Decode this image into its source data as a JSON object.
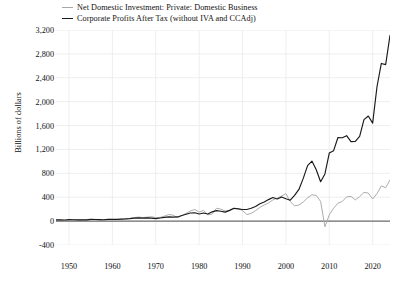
{
  "chart_data": {
    "type": "line",
    "title": "",
    "subtitle": "",
    "xlabel": "",
    "ylabel": "Billions of dollars",
    "xlim": [
      1947,
      2024
    ],
    "ylim": [
      -400,
      3200
    ],
    "grid": true,
    "legend_position": "top",
    "yticks": [
      "3,200",
      "2,800",
      "2,400",
      "2,000",
      "1,600",
      "1,200",
      "800",
      "400",
      "0",
      "-400"
    ],
    "ytick_values": [
      3200,
      2800,
      2400,
      2000,
      1600,
      1200,
      800,
      400,
      0,
      -400
    ],
    "xticks": [
      "1950",
      "1960",
      "1970",
      "1980",
      "1990",
      "2000",
      "2010",
      "2020"
    ],
    "xtick_values": [
      1950,
      1960,
      1970,
      1980,
      1990,
      2000,
      2010,
      2020
    ],
    "zero_line": 0,
    "series": [
      {
        "name": "Net Domestic Investment: Private: Domestic Business",
        "color": "#a8a8a8",
        "x": [
          1947,
          1948,
          1949,
          1950,
          1951,
          1952,
          1953,
          1954,
          1955,
          1956,
          1957,
          1958,
          1959,
          1960,
          1961,
          1962,
          1963,
          1964,
          1965,
          1966,
          1967,
          1968,
          1969,
          1970,
          1971,
          1972,
          1973,
          1974,
          1975,
          1976,
          1977,
          1978,
          1979,
          1980,
          1981,
          1982,
          1983,
          1984,
          1985,
          1986,
          1987,
          1988,
          1989,
          1990,
          1991,
          1992,
          1993,
          1994,
          1995,
          1996,
          1997,
          1998,
          1999,
          2000,
          2001,
          2002,
          2003,
          2004,
          2005,
          2006,
          2007,
          2008,
          2009,
          2010,
          2011,
          2012,
          2013,
          2014,
          2015,
          2016,
          2017,
          2018,
          2019,
          2020,
          2021,
          2022,
          2023,
          2024
        ],
        "y": [
          12,
          14,
          6,
          20,
          22,
          18,
          20,
          15,
          28,
          30,
          26,
          14,
          28,
          28,
          24,
          32,
          36,
          44,
          58,
          68,
          60,
          66,
          74,
          58,
          62,
          84,
          110,
          100,
          58,
          90,
          130,
          170,
          195,
          150,
          180,
          105,
          120,
          215,
          200,
          170,
          175,
          205,
          210,
          175,
          110,
          130,
          175,
          230,
          270,
          305,
          355,
          385,
          420,
          460,
          330,
          255,
          270,
          320,
          390,
          440,
          430,
          330,
          -95,
          105,
          215,
          300,
          330,
          405,
          415,
          355,
          410,
          480,
          470,
          370,
          460,
          590,
          560,
          690
        ]
      },
      {
        "name": "Corporate Profits After Tax (without IVA and CCAdj)",
        "color": "#1a1a1a",
        "x": [
          1947,
          1948,
          1949,
          1950,
          1951,
          1952,
          1953,
          1954,
          1955,
          1956,
          1957,
          1958,
          1959,
          1960,
          1961,
          1962,
          1963,
          1964,
          1965,
          1966,
          1967,
          1968,
          1969,
          1970,
          1971,
          1972,
          1973,
          1974,
          1975,
          1976,
          1977,
          1978,
          1979,
          1980,
          1981,
          1982,
          1983,
          1984,
          1985,
          1986,
          1987,
          1988,
          1989,
          1990,
          1991,
          1992,
          1993,
          1994,
          1995,
          1996,
          1997,
          1998,
          1999,
          2000,
          2001,
          2002,
          2003,
          2004,
          2005,
          2006,
          2007,
          2008,
          2009,
          2010,
          2011,
          2012,
          2013,
          2014,
          2015,
          2016,
          2017,
          2018,
          2019,
          2020,
          2021,
          2022,
          2023,
          2024
        ],
        "y": [
          20,
          22,
          19,
          25,
          22,
          21,
          22,
          21,
          28,
          27,
          26,
          22,
          30,
          28,
          28,
          34,
          37,
          42,
          50,
          54,
          50,
          54,
          50,
          42,
          52,
          62,
          72,
          66,
          70,
          95,
          115,
          135,
          140,
          120,
          135,
          120,
          155,
          175,
          165,
          150,
          180,
          215,
          205,
          195,
          195,
          215,
          245,
          290,
          320,
          360,
          395,
          370,
          405,
          375,
          350,
          430,
          530,
          715,
          930,
          1005,
          860,
          660,
          790,
          1140,
          1180,
          1400,
          1395,
          1430,
          1330,
          1335,
          1420,
          1700,
          1760,
          1640,
          2250,
          2640,
          2620,
          3110
        ]
      }
    ]
  },
  "legend": {
    "entries": [
      {
        "label": "Net Domestic Investment: Private: Domestic Business",
        "color": "#a8a8a8"
      },
      {
        "label": "Corporate Profits After Tax (without IVA and CCAdj)",
        "color": "#1a1a1a"
      }
    ]
  },
  "axes": {
    "y_title": "Billions of dollars"
  },
  "colors": {
    "grid": "#ececec",
    "zero_line": "#6a6a6a",
    "text": "#111111",
    "background": "#ffffff"
  }
}
